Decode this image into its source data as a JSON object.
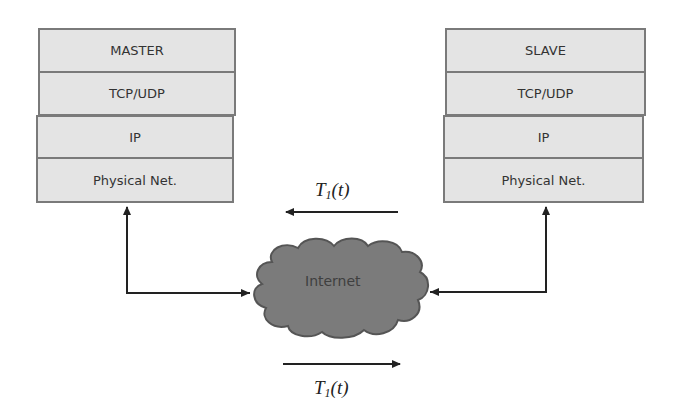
{
  "diagram": {
    "master_stack": {
      "layers": [
        "MASTER",
        "TCP/UDP",
        "IP",
        "Physical Net."
      ]
    },
    "slave_stack": {
      "layers": [
        "SLAVE",
        "TCP/UDP",
        "IP",
        "Physical Net."
      ]
    },
    "network": {
      "label": "Internet",
      "icon": "cloud-icon"
    },
    "arrows": {
      "top": {
        "label_main": "T",
        "label_sub": "1",
        "label_tail": "(t)",
        "direction": "slave-to-master"
      },
      "bottom": {
        "label_main": "T",
        "label_sub": "1",
        "label_tail": "(t)",
        "direction": "master-to-slave"
      }
    },
    "colors": {
      "layer_fill": "#e4e4e4",
      "layer_border": "#7a7a7a",
      "cloud_fill": "#7b7b7b",
      "cloud_outline": "#555555",
      "line": "#222222"
    }
  }
}
